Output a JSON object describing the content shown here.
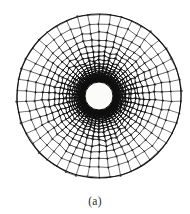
{
  "figure": {
    "caption": "(a)",
    "kind": "radial-annular-mesh",
    "background_color": "#ffffff",
    "line_color": "#111111",
    "hole_fill_color": "#fbfbf9"
  },
  "chart_data": {
    "type": "scatter",
    "title": "(a)",
    "xlabel": "",
    "ylabel": "",
    "grid": false,
    "legend": null,
    "geometry": {
      "outer_radius": 82,
      "inner_radius": 14,
      "center_x": 99,
      "center_y": 96,
      "radial_divisions": 26,
      "angular_divisions": 46,
      "grading": "geometric, ratio 1.17 outward from inner hole",
      "line_overshoot_px": 1.6,
      "node_jitter_px": 1.1
    },
    "categories": [
      "outer boundary",
      "inner boundary",
      "radial rings",
      "circumferential spokes"
    ],
    "values": [
      1,
      1,
      26,
      46
    ]
  }
}
